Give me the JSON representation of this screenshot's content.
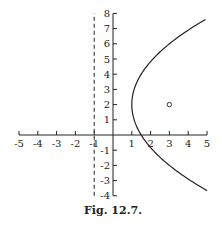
{
  "figure": {
    "caption": "Fig. 12.7."
  },
  "chart_data": {
    "type": "line",
    "title": "",
    "caption": "Fig. 12.7.",
    "xlabel": "",
    "ylabel": "",
    "xlim": [
      -5,
      5
    ],
    "ylim": [
      -4,
      8
    ],
    "x_ticks": [
      -5,
      -4,
      -3,
      -2,
      -1,
      1,
      2,
      3,
      4,
      5
    ],
    "y_ticks": [
      -4,
      -3,
      -2,
      -1,
      1,
      2,
      3,
      4,
      5,
      6,
      7,
      8
    ],
    "grid": false,
    "series": [
      {
        "name": "parabola",
        "equation": "(y-2)^2 = 8(x-1)",
        "style": "solid",
        "x": [
          5.0,
          4.13,
          3.0,
          2.13,
          1.5,
          1.13,
          1.0,
          1.13,
          1.5,
          2.13,
          3.0,
          4.13,
          4.92
        ],
        "y": [
          -3.66,
          -3.0,
          -2.0,
          -1.0,
          0.0,
          1.0,
          2.0,
          3.0,
          4.0,
          5.0,
          6.0,
          7.0,
          7.6
        ]
      },
      {
        "name": "directrix",
        "equation": "x = -1",
        "style": "dashed",
        "x": [
          -1,
          -1
        ],
        "y": [
          -4,
          8
        ]
      }
    ],
    "points": [
      {
        "name": "focus",
        "x": 3,
        "y": 2,
        "marker": "open-circle"
      }
    ]
  }
}
